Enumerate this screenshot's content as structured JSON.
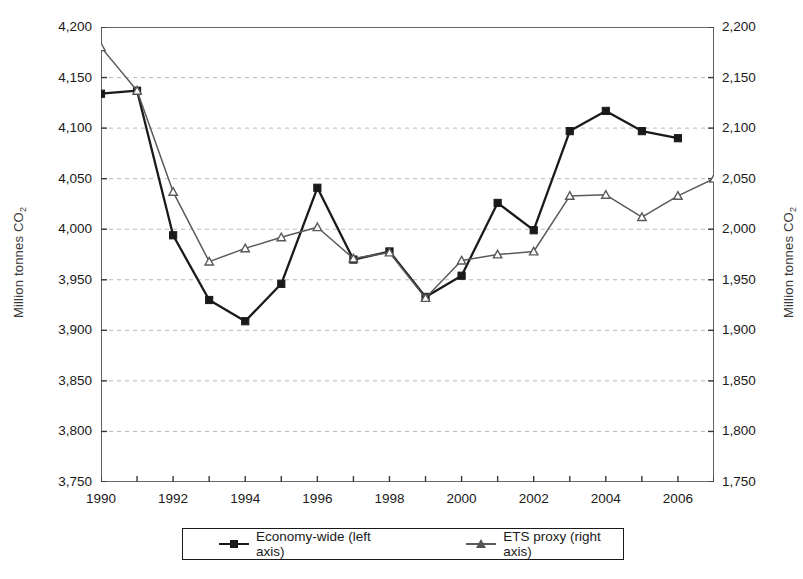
{
  "chart_data": {
    "type": "line",
    "title": "",
    "xlabel": "",
    "ylabel": "Million tonnes CO2",
    "ylabel_right": "Million tonnes CO2",
    "grid": true,
    "legend_position": "bottom",
    "x": [
      1990,
      1991,
      1992,
      1993,
      1994,
      1995,
      1996,
      1997,
      1998,
      1999,
      2000,
      2001,
      2002,
      2003,
      2004,
      2005,
      2006,
      2007
    ],
    "xticks": [
      1990,
      1992,
      1994,
      1996,
      1998,
      2000,
      2002,
      2004,
      2006
    ],
    "ylim": [
      3750,
      4200
    ],
    "yticks": [
      "3,750",
      "3,800",
      "3,850",
      "3,900",
      "3,950",
      "4,000",
      "4,050",
      "4,100",
      "4,150",
      "4,200"
    ],
    "ylim_right": [
      1750,
      2200
    ],
    "yticks_right": [
      "1,750",
      "1,800",
      "1,850",
      "1,900",
      "1,950",
      "2,000",
      "2,050",
      "2,100",
      "2,150",
      "2,200"
    ],
    "series": [
      {
        "name": "Economy-wide (left axis)",
        "axis": "left",
        "color": "#1a1a1a",
        "marker": "square",
        "values": [
          4134,
          4137,
          3994,
          3930,
          3909,
          3946,
          4041,
          3970,
          3978,
          3933,
          3954,
          4026,
          3999,
          4097,
          4117,
          4097,
          4090,
          null
        ]
      },
      {
        "name": "ETS proxy (right axis)",
        "axis": "right",
        "color": "#5a5a5a",
        "marker": "triangle",
        "values": [
          2180,
          2137,
          2037,
          1968,
          1981,
          1992,
          2002,
          1971,
          1977,
          1932,
          1969,
          1975,
          1978,
          2033,
          2034,
          2012,
          2033,
          2050
        ]
      }
    ]
  },
  "legend": {
    "items": [
      {
        "label": "Economy-wide (left axis)",
        "marker": "square-marker-icon"
      },
      {
        "label": "ETS proxy (right axis)",
        "marker": "triangle-marker-icon"
      }
    ]
  }
}
